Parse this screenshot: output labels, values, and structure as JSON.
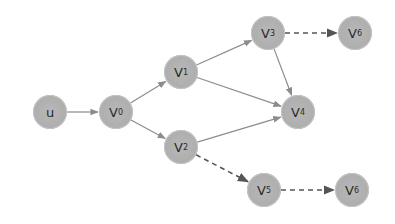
{
  "diagram": {
    "type": "directed-graph",
    "nodes": [
      {
        "id": "u",
        "label": "u",
        "sub": "",
        "x": 50,
        "y": 112
      },
      {
        "id": "v0",
        "label": "V",
        "sub": "0",
        "x": 116,
        "y": 112
      },
      {
        "id": "v1",
        "label": "V",
        "sub": "1",
        "x": 181,
        "y": 72
      },
      {
        "id": "v2",
        "label": "V",
        "sub": "2",
        "x": 181,
        "y": 147
      },
      {
        "id": "v3",
        "label": "V",
        "sub": "3",
        "x": 268,
        "y": 33
      },
      {
        "id": "v4",
        "label": "V",
        "sub": "4",
        "x": 298,
        "y": 112
      },
      {
        "id": "v5",
        "label": "V",
        "sub": "5",
        "x": 264,
        "y": 190
      },
      {
        "id": "v6",
        "label": "V",
        "sub": "6",
        "x": 355,
        "y": 33
      },
      {
        "id": "v7",
        "label": "V",
        "sub": "6",
        "x": 352,
        "y": 190
      }
    ],
    "edges": [
      {
        "from": "u",
        "to": "v0",
        "style": "solid"
      },
      {
        "from": "v0",
        "to": "v1",
        "style": "solid"
      },
      {
        "from": "v0",
        "to": "v2",
        "style": "solid"
      },
      {
        "from": "v1",
        "to": "v3",
        "style": "solid"
      },
      {
        "from": "v1",
        "to": "v4",
        "style": "solid"
      },
      {
        "from": "v2",
        "to": "v4",
        "style": "solid"
      },
      {
        "from": "v3",
        "to": "v4",
        "style": "solid"
      },
      {
        "from": "v3",
        "to": "v6",
        "style": "dashed"
      },
      {
        "from": "v2",
        "to": "v5",
        "style": "dashed"
      },
      {
        "from": "v5",
        "to": "v7",
        "style": "dashed"
      }
    ],
    "colors": {
      "node_fill": "#acacac",
      "solid_edge": "#8c8c8c",
      "dashed_edge": "#555555",
      "label": "#2a2a2a"
    }
  }
}
